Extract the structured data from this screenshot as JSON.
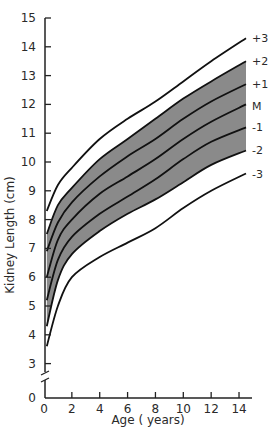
{
  "chart_data": {
    "type": "line",
    "title": "",
    "xlabel": "Age ( years)",
    "ylabel": "Kidney Length (cm)",
    "xlim": [
      0,
      15
    ],
    "ylim": [
      0,
      15
    ],
    "y_axis_break": [
      0,
      3
    ],
    "grid": false,
    "x_ticks": [
      0,
      2,
      4,
      6,
      8,
      10,
      12,
      14
    ],
    "y_ticks": [
      0,
      3,
      4,
      5,
      6,
      7,
      8,
      9,
      10,
      11,
      12,
      13,
      14,
      15
    ],
    "shaded_band": {
      "from_series": "-2",
      "to_series": "+2",
      "color": "#8a8a8a"
    },
    "x": [
      0.2,
      1,
      2,
      4,
      6,
      8,
      10,
      12,
      14.5
    ],
    "series": [
      {
        "name": "+3",
        "values": [
          8.3,
          9.2,
          9.8,
          10.8,
          11.5,
          12.1,
          12.8,
          13.5,
          14.3
        ]
      },
      {
        "name": "+2",
        "values": [
          7.5,
          8.5,
          9.1,
          10.1,
          10.8,
          11.5,
          12.2,
          12.8,
          13.5
        ]
      },
      {
        "name": "+1",
        "values": [
          6.9,
          7.9,
          8.6,
          9.5,
          10.2,
          10.8,
          11.5,
          12.1,
          12.7
        ]
      },
      {
        "name": "M",
        "values": [
          6.0,
          7.3,
          8.0,
          8.9,
          9.5,
          10.1,
          10.8,
          11.4,
          12.0
        ]
      },
      {
        "name": "-1",
        "values": [
          5.2,
          6.6,
          7.4,
          8.2,
          8.8,
          9.4,
          10.1,
          10.7,
          11.2
        ]
      },
      {
        "name": "-2",
        "values": [
          4.3,
          5.9,
          6.8,
          7.6,
          8.2,
          8.7,
          9.3,
          9.9,
          10.4
        ]
      },
      {
        "name": "-3",
        "values": [
          3.6,
          5.0,
          6.0,
          6.7,
          7.2,
          7.7,
          8.4,
          9.0,
          9.6
        ]
      }
    ],
    "series_labels": [
      {
        "text": "+3",
        "y_value": 14.3
      },
      {
        "text": "+2",
        "y_value": 13.5
      },
      {
        "text": "+1",
        "y_value": 12.7
      },
      {
        "text": "M",
        "y_value": 11.95
      },
      {
        "text": "-1",
        "y_value": 11.2
      },
      {
        "text": "-2",
        "y_value": 10.4
      },
      {
        "text": "-3",
        "y_value": 9.6
      }
    ]
  }
}
